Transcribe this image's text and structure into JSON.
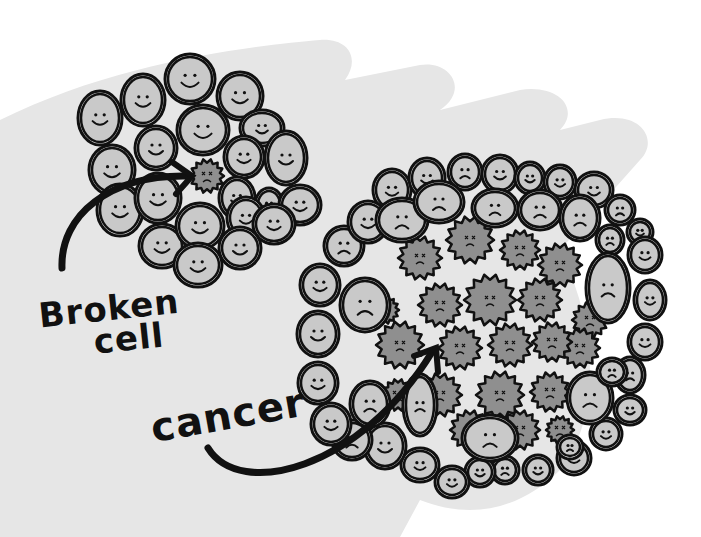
{
  "labels": {
    "broken_line1": "Broken",
    "broken_line2": "cell",
    "cancer": "cancer"
  },
  "colors": {
    "background": "#ffffff",
    "hand": "#e6e6e6",
    "healthy_cell_fill": "#c9c9c9",
    "cancer_cell_fill": "#8f8f8f",
    "outline": "#111111"
  },
  "small_cluster": {
    "healthy_cells": [
      [
        100,
        118,
        19,
        24
      ],
      [
        143,
        100,
        19,
        23
      ],
      [
        190,
        79,
        22,
        22
      ],
      [
        240,
        96,
        20,
        21
      ],
      [
        262,
        128,
        19,
        15
      ],
      [
        112,
        170,
        20,
        22
      ],
      [
        156,
        148,
        18,
        19
      ],
      [
        203,
        130,
        23,
        22
      ],
      [
        244,
        157,
        17,
        18
      ],
      [
        286,
        158,
        18,
        24
      ],
      [
        120,
        210,
        20,
        23
      ],
      [
        158,
        198,
        20,
        22
      ],
      [
        237,
        198,
        15,
        18
      ],
      [
        269,
        205,
        11,
        14
      ],
      [
        300,
        205,
        18,
        17
      ],
      [
        162,
        246,
        20,
        19
      ],
      [
        200,
        226,
        21,
        20
      ],
      [
        246,
        218,
        16,
        18
      ],
      [
        274,
        224,
        18,
        17
      ],
      [
        240,
        248,
        18,
        18
      ],
      [
        198,
        265,
        21,
        19
      ]
    ],
    "broken_cell": [
      207,
      176,
      17
    ]
  },
  "large_cluster": {
    "rim_cells": [
      [
        392,
        190,
        16,
        18
      ],
      [
        427,
        178,
        15,
        17
      ],
      [
        465,
        172,
        14,
        15
      ],
      [
        500,
        174,
        15,
        16
      ],
      [
        530,
        178,
        12,
        13
      ],
      [
        560,
        182,
        13,
        14
      ],
      [
        594,
        190,
        16,
        15
      ],
      [
        620,
        210,
        12,
        12
      ],
      [
        640,
        232,
        10,
        10
      ],
      [
        645,
        255,
        14,
        15
      ],
      [
        650,
        300,
        13,
        17
      ],
      [
        645,
        342,
        14,
        15
      ],
      [
        630,
        375,
        12,
        15
      ],
      [
        630,
        410,
        13,
        12
      ],
      [
        606,
        434,
        13,
        13
      ],
      [
        574,
        458,
        14,
        14
      ],
      [
        538,
        470,
        12,
        12
      ],
      [
        505,
        470,
        11,
        11
      ],
      [
        480,
        472,
        12,
        12
      ],
      [
        452,
        482,
        14,
        13
      ],
      [
        420,
        465,
        16,
        14
      ],
      [
        385,
        446,
        18,
        20
      ],
      [
        352,
        440,
        17,
        17
      ],
      [
        331,
        424,
        17,
        18
      ],
      [
        318,
        383,
        17,
        18
      ],
      [
        318,
        334,
        18,
        20
      ],
      [
        320,
        285,
        17,
        18
      ],
      [
        344,
        246,
        17,
        17
      ],
      [
        368,
        222,
        17,
        18
      ],
      [
        402,
        220,
        23,
        19
      ],
      [
        439,
        202,
        22,
        18
      ],
      [
        495,
        208,
        20,
        16
      ],
      [
        540,
        210,
        19,
        17
      ],
      [
        580,
        218,
        17,
        20
      ],
      [
        610,
        240,
        11,
        12
      ],
      [
        608,
        288,
        19,
        32
      ],
      [
        590,
        398,
        20,
        23
      ],
      [
        612,
        372,
        12,
        11
      ],
      [
        365,
        305,
        22,
        24
      ],
      [
        370,
        404,
        17,
        20
      ],
      [
        420,
        405,
        14,
        28
      ],
      [
        490,
        438,
        25,
        20
      ],
      [
        570,
        447,
        10,
        9
      ]
    ],
    "cancer_cells": [
      [
        420,
        258,
        22
      ],
      [
        470,
        240,
        24
      ],
      [
        520,
        250,
        20
      ],
      [
        560,
        265,
        22
      ],
      [
        590,
        320,
        18
      ],
      [
        440,
        305,
        22
      ],
      [
        490,
        300,
        26
      ],
      [
        540,
        300,
        22
      ],
      [
        580,
        348,
        20
      ],
      [
        400,
        345,
        24
      ],
      [
        460,
        348,
        22
      ],
      [
        510,
        345,
        22
      ],
      [
        552,
        342,
        20
      ],
      [
        440,
        395,
        22
      ],
      [
        500,
        395,
        24
      ],
      [
        550,
        392,
        20
      ],
      [
        398,
        395,
        16
      ],
      [
        520,
        430,
        20
      ],
      [
        560,
        430,
        14
      ],
      [
        385,
        310,
        14
      ],
      [
        470,
        430,
        20
      ]
    ]
  }
}
